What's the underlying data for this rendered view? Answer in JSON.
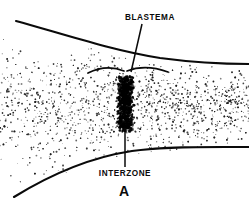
{
  "figure": {
    "letter": "A",
    "background_color": "#ffffff",
    "ink_color": "#0a0a0a",
    "width": 249,
    "height": 201
  },
  "labels": {
    "blastema": {
      "text": "BLASTEMA",
      "x": 150,
      "y": 20,
      "leader_from_x": 142,
      "leader_from_y": 24,
      "leader_to_x": 131,
      "leader_to_y": 72
    },
    "interzone": {
      "text": "INTERZONE",
      "x": 125,
      "y": 176,
      "leader_from_x": 125,
      "leader_from_y": 128,
      "leader_to_x": 125,
      "leader_to_y": 167
    }
  },
  "structures": {
    "upper_boundary": {
      "name": "upper-bone-outline",
      "path": "M 16 21 C 60 33, 110 50, 160 58 C 190 62, 220 64, 249 64"
    },
    "lower_boundary": {
      "name": "lower-bone-outline",
      "path": "M 14 197 C 48 176, 86 158, 132 151 C 170 146, 212 147, 249 147"
    },
    "blastema_arc_left": {
      "name": "blastema-arc-left",
      "path": "M 88 73 C 100 67, 112 66, 124 71"
    },
    "blastema_arc_right": {
      "name": "blastema-arc-right",
      "path": "M 127 71 C 140 66, 154 67, 168 72"
    },
    "interzone_column": {
      "name": "interzone-dense-column",
      "x": 118,
      "y": 76,
      "width": 15,
      "height": 56
    },
    "stipple_band": {
      "name": "cartilage-stipple-field",
      "top": 24,
      "bottom": 190,
      "description": "stippled mesenchyme field between bone outlines"
    }
  }
}
